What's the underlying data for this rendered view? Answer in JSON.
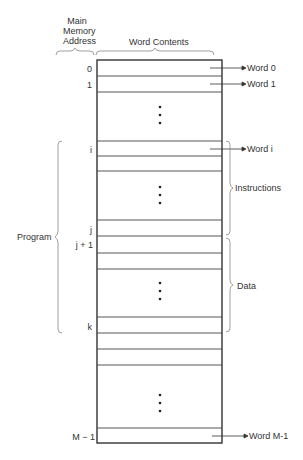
{
  "headers": {
    "address_line1": "Main",
    "address_line2": "Memory",
    "address_line3": "Address",
    "contents": "Word Contents"
  },
  "addresses": {
    "a0": "0",
    "a1": "1",
    "ai": "i",
    "aj": "j",
    "aj1": "j + 1",
    "ak": "k",
    "am1": "M − 1"
  },
  "word_labels": {
    "w0": "Word 0",
    "w1": "Word 1",
    "wi": "Word i",
    "wm1": "Word M-1"
  },
  "groups": {
    "program": "Program",
    "instructions": "Instructions",
    "data": "Data"
  },
  "colors": {
    "line": "#333333",
    "brace": "#888888"
  }
}
